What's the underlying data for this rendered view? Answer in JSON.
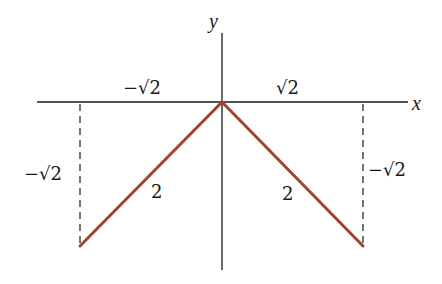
{
  "diagram": {
    "axes": {
      "x_label": "x",
      "y_label": "y"
    },
    "tick_labels": {
      "x_negative": "−√2",
      "x_positive": "√2",
      "y_left": "−√2",
      "y_right": "−√2"
    },
    "segments": [
      {
        "name": "left-segment",
        "from": [
          0,
          0
        ],
        "to": [
          -1.414,
          -1.414
        ],
        "length_label": "2"
      },
      {
        "name": "right-segment",
        "from": [
          0,
          0
        ],
        "to": [
          1.414,
          -1.414
        ],
        "length_label": "2"
      }
    ],
    "colors": {
      "segment": "#a0442a",
      "axis": "#1a1a1a"
    }
  }
}
